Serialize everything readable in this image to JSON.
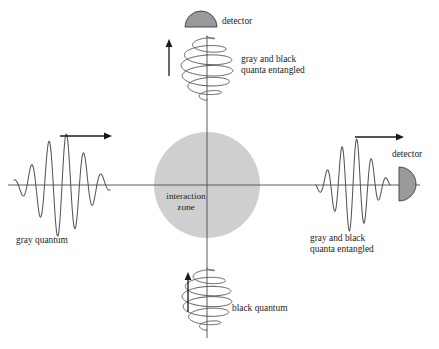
{
  "figure": {
    "background_color": "#ffffff",
    "width": 439,
    "height": 349
  },
  "colors": {
    "axis": "#4a4a4a",
    "wave": "#555555",
    "arrow": "#1a1a1a",
    "detector_fill": "#9a9a9a",
    "detector_stroke": "#3d3d3d",
    "zone_fill": "#cfcfcf",
    "text": "#1d1d1d"
  },
  "labels": {
    "detector_top": "detector",
    "detector_right": "detector",
    "entangled_top_line1": "gray and black",
    "entangled_top_line2": "quanta entangled",
    "entangled_right_line1": "gray and black",
    "entangled_right_line2": "quanta entangled",
    "gray_quantum": "gray quantum",
    "black_quantum": "black quantum",
    "interaction_zone_line1": "interaction",
    "interaction_zone_line2": "zone"
  },
  "elements": {
    "interaction_zone": {
      "name": "interaction-zone",
      "cx": 207,
      "cy": 185,
      "r": 53
    },
    "axis_horizontal": {
      "x1": 8,
      "y1": 185,
      "x2": 420,
      "y2": 185
    },
    "axis_vertical": {
      "x1": 207,
      "y1": 36,
      "x2": 207,
      "y2": 338
    },
    "detector_top": {
      "shape": "semicircle-flat-bottom",
      "cx": 201,
      "cy": 27,
      "r": 16
    },
    "detector_right": {
      "shape": "semicircle-flat-left",
      "cx": 399,
      "cy": 184,
      "r": 17
    },
    "arrow_left": {
      "x1": 60,
      "y1": 136,
      "x2": 112,
      "y2": 136,
      "direction": "right"
    },
    "arrow_right": {
      "x1": 355,
      "y1": 137,
      "x2": 404,
      "y2": 137,
      "direction": "right"
    },
    "arrow_top": {
      "x1": 169,
      "y1": 76,
      "x2": 169,
      "y2": 39,
      "direction": "up"
    },
    "arrow_bottom": {
      "x1": 188,
      "y1": 312,
      "x2": 188,
      "y2": 272,
      "direction": "up"
    },
    "wave_left": {
      "name": "gray-quantum-wavepacket",
      "center_x": 62,
      "center_y": 185,
      "half_width": 48,
      "amplitude": 52,
      "cycles": 5.5
    },
    "wave_right": {
      "name": "entangled-wavepacket",
      "center_x": 353,
      "center_y": 185,
      "half_width": 37,
      "amplitude": 47,
      "cycles": 5.0
    },
    "helix_top": {
      "name": "entangled-helix",
      "axis_x": 207,
      "top_y": 36,
      "bottom_y": 100,
      "coils": 6,
      "max_radius": 26
    },
    "helix_bottom": {
      "name": "black-quantum-helix",
      "axis_x": 207,
      "top_y": 268,
      "bottom_y": 330,
      "coils": 6,
      "max_radius": 25
    }
  },
  "label_positions": {
    "detector_top": {
      "x": 222,
      "y": 24
    },
    "detector_right": {
      "x": 392,
      "y": 157
    },
    "entangled_top": {
      "x": 241,
      "y": 62
    },
    "entangled_right": {
      "x": 310,
      "y": 241
    },
    "gray_quantum": {
      "x": 16,
      "y": 243
    },
    "black_quantum": {
      "x": 232,
      "y": 311
    },
    "interaction_zone": {
      "x": 186,
      "y": 199
    }
  }
}
